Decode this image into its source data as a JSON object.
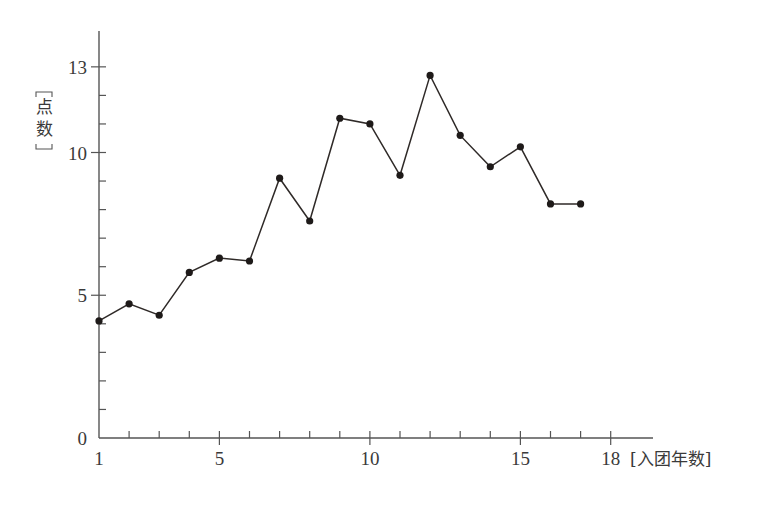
{
  "chart_data": {
    "type": "line",
    "title": "",
    "xlabel": "[入团年数]",
    "ylabel": "[点数]",
    "ylabel_chars": [
      "点",
      "数"
    ],
    "x": [
      1,
      2,
      3,
      4,
      5,
      6,
      7,
      8,
      9,
      10,
      11,
      12,
      13,
      14,
      15,
      16,
      17
    ],
    "series": [
      {
        "name": "点数",
        "values": [
          4.1,
          4.7,
          4.3,
          5.8,
          6.3,
          6.2,
          9.1,
          7.6,
          11.2,
          11.0,
          9.2,
          12.7,
          10.6,
          9.5,
          10.2,
          8.2,
          8.2
        ]
      }
    ],
    "xlim": [
      1,
      18
    ],
    "ylim": [
      0,
      13
    ],
    "x_ticks": [
      1,
      2,
      3,
      4,
      5,
      6,
      7,
      8,
      9,
      10,
      11,
      12,
      13,
      14,
      15,
      16,
      17,
      18
    ],
    "x_tick_labels": [
      "1",
      "5",
      "10",
      "15",
      "18"
    ],
    "x_tick_label_values": [
      1,
      5,
      10,
      15,
      18
    ],
    "y_ticks": [
      0,
      1,
      2,
      3,
      4,
      5,
      6,
      7,
      8,
      9,
      10,
      11,
      12,
      13
    ],
    "y_tick_labels": [
      "0",
      "5",
      "10",
      "13"
    ],
    "y_tick_label_values": [
      0,
      5,
      10,
      13
    ],
    "grid": false,
    "legend": "none",
    "marker": "filled-circle",
    "line_color": "#2f2a28",
    "marker_color": "#1e1a19",
    "axis_color": "#555555"
  }
}
